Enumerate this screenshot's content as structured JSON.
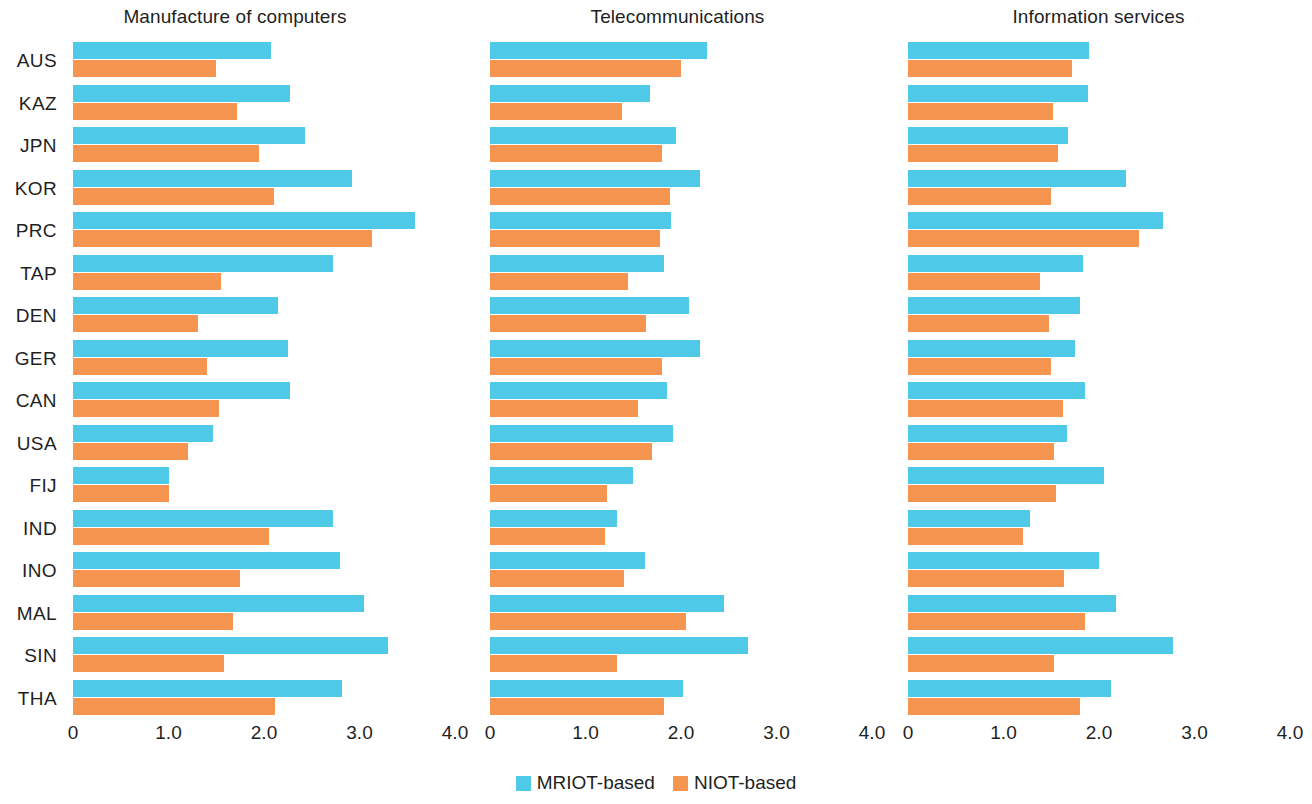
{
  "legend": {
    "position": "bottom-center",
    "entries": [
      {
        "label": "MRIOT-based",
        "color": "#4fc9e8",
        "icon": "square-swatch-icon"
      },
      {
        "label": "NIOT-based",
        "color": "#f5954f",
        "icon": "square-swatch-icon"
      }
    ]
  },
  "panels": [
    {
      "title": "Manufacture of computers"
    },
    {
      "title": "Telecommunications"
    },
    {
      "title": "Information services"
    }
  ],
  "axis": {
    "ticks": [
      "0",
      "1.0",
      "2.0",
      "3.0",
      "4.0"
    ],
    "tick_values": [
      0,
      1,
      2,
      3,
      4
    ]
  },
  "chart_data": {
    "type": "bar",
    "orientation": "horizontal",
    "title": "",
    "xlabel": "",
    "ylabel": "",
    "xlim": [
      0,
      4.0
    ],
    "xticks": [
      0,
      1.0,
      2.0,
      3.0,
      4.0
    ],
    "xticklabels": [
      "0",
      "1.0",
      "2.0",
      "3.0",
      "4.0"
    ],
    "grid": false,
    "legend": [
      "MRIOT-based",
      "NIOT-based"
    ],
    "legend_position": "bottom-center",
    "colors": {
      "MRIOT-based": "#4fc9e8",
      "NIOT-based": "#f5954f"
    },
    "categories": [
      "AUS",
      "KAZ",
      "JPN",
      "KOR",
      "PRC",
      "TAP",
      "DEN",
      "GER",
      "CAN",
      "USA",
      "FIJ",
      "IND",
      "INO",
      "MAL",
      "SIN",
      "THA"
    ],
    "panels": [
      {
        "title": "Manufacture of computers",
        "series": [
          {
            "name": "MRIOT-based",
            "values": [
              2.07,
              2.27,
              2.43,
              2.92,
              3.58,
              2.72,
              2.15,
              2.25,
              2.27,
              1.47,
              1.0,
              2.72,
              2.8,
              3.05,
              3.3,
              2.82
            ]
          },
          {
            "name": "NIOT-based",
            "values": [
              1.5,
              1.72,
              1.95,
              2.1,
              3.13,
              1.55,
              1.31,
              1.4,
              1.53,
              1.2,
              1.0,
              2.05,
              1.75,
              1.68,
              1.58,
              2.12
            ]
          }
        ]
      },
      {
        "title": "Telecommunications",
        "series": [
          {
            "name": "MRIOT-based",
            "values": [
              2.27,
              1.68,
              1.95,
              2.2,
              1.9,
              1.82,
              2.08,
              2.2,
              1.85,
              1.92,
              1.5,
              1.33,
              1.62,
              2.45,
              2.7,
              2.02
            ]
          },
          {
            "name": "NIOT-based",
            "values": [
              2.0,
              1.38,
              1.8,
              1.88,
              1.78,
              1.45,
              1.63,
              1.8,
              1.55,
              1.7,
              1.22,
              1.2,
              1.4,
              2.05,
              1.33,
              1.82
            ]
          }
        ]
      },
      {
        "title": "Information services",
        "series": [
          {
            "name": "MRIOT-based",
            "values": [
              1.9,
              1.88,
              1.68,
              2.28,
              2.67,
              1.83,
              1.8,
              1.75,
              1.85,
              1.67,
              2.05,
              1.28,
              2.0,
              2.18,
              2.78,
              2.13
            ]
          },
          {
            "name": "NIOT-based",
            "values": [
              1.72,
              1.52,
              1.57,
              1.5,
              2.42,
              1.38,
              1.48,
              1.5,
              1.62,
              1.53,
              1.55,
              1.2,
              1.63,
              1.85,
              1.53,
              1.8
            ]
          }
        ]
      }
    ]
  }
}
